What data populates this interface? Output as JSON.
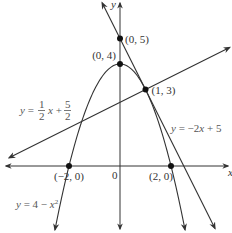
{
  "chart_data": {
    "type": "line",
    "title": "",
    "xlabel": "x",
    "ylabel": "y",
    "xlim": [
      -4.6,
      4.4
    ],
    "ylim": [
      -2.6,
      6.5
    ],
    "grid": false,
    "legend": "none",
    "origin_label": "0",
    "series": [
      {
        "name": "y = 4 - x^2",
        "label_text": "y = 4 − x",
        "label_sup": "2",
        "kind": "parabola",
        "a": -1,
        "b": 0,
        "c": 4
      },
      {
        "name": "y = -2x + 5",
        "label_text": "y = −2x + 5",
        "kind": "line",
        "slope": -2,
        "intercept": 5
      },
      {
        "name": "y = 1/2 x + 5/2",
        "label_prefix": "y = ",
        "label_num1": "1",
        "label_den1": "2",
        "label_mid": " x + ",
        "label_num2": "5",
        "label_den2": "2",
        "kind": "line",
        "slope": 0.5,
        "intercept": 2.5
      }
    ],
    "points": [
      {
        "label": "(0, 5)",
        "x": 0,
        "y": 5
      },
      {
        "label": "(0, 4)",
        "x": 0,
        "y": 4
      },
      {
        "label": "(1, 3)",
        "x": 1,
        "y": 3
      },
      {
        "label": "(−2, 0)",
        "x": -2,
        "y": 0
      },
      {
        "label": "(2, 0)",
        "x": 2,
        "y": 0
      }
    ]
  }
}
